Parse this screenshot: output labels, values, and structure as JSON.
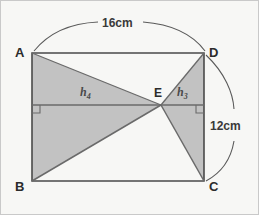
{
  "figure": {
    "background_color": "#f7f7f5",
    "border_color": "#c9c9c9",
    "line_color": "#555555",
    "shade_color": "#c0c0c0",
    "vertices": {
      "a": "A",
      "b": "B",
      "c": "C",
      "d": "D",
      "e": "E"
    },
    "dimensions": {
      "width_label": "16cm",
      "height_label": "12cm"
    },
    "heights": {
      "left": "h",
      "left_sub": "4",
      "right": "h",
      "right_sub": "3"
    },
    "right_angle_markers": 2
  }
}
